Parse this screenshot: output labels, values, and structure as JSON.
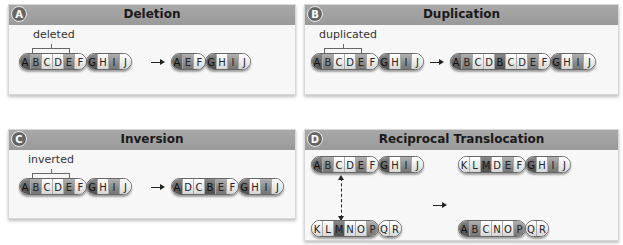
{
  "panels": [
    {
      "badge": "A",
      "title": "Deletion",
      "annotation": "deleted",
      "before": [
        "ABCDEF",
        "GHIJ"
      ],
      "after": [
        "AEF",
        "GHIJ"
      ]
    },
    {
      "badge": "B",
      "title": "Duplication",
      "annotation": "duplicated",
      "before": [
        "ABCDEF",
        "GHIJ"
      ],
      "after": [
        "ABCDBCDEF",
        "GHIJ"
      ]
    },
    {
      "badge": "C",
      "title": "Inversion",
      "annotation": "inverted",
      "before": [
        "ABCDEF",
        "GHIJ"
      ],
      "after": [
        "ADCBEF",
        "GHIJ"
      ]
    },
    {
      "badge": "D",
      "title": "Reciprocal Translocation",
      "before_top": [
        "ABCDEF",
        "GHIJ"
      ],
      "before_bottom": [
        "KLMNOP",
        "QR"
      ],
      "after_top": [
        "KLMDEF",
        "GHIJ"
      ],
      "after_bottom": [
        "ABCNOP",
        "QR"
      ]
    }
  ]
}
